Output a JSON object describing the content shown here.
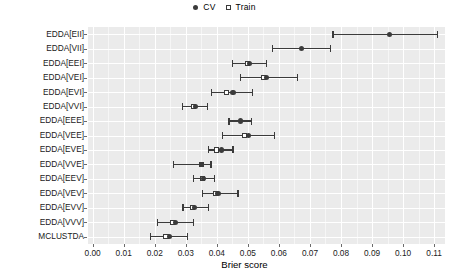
{
  "legend": {
    "position": "top-center",
    "items": [
      {
        "label": "CV",
        "marker": "filled-circle",
        "color": "#3b3b3b"
      },
      {
        "label": "Train",
        "marker": "open-square",
        "color": "#3b3b3b"
      }
    ]
  },
  "axes": {
    "xlabel": "Brier score",
    "ylabel": "",
    "xlim": [
      -0.0015,
      0.1135
    ],
    "xticks": [
      0.0,
      0.01,
      0.02,
      0.03,
      0.04,
      0.05,
      0.06,
      0.07,
      0.08,
      0.09,
      0.1,
      0.11
    ],
    "xticklabels": [
      "0.00",
      "0.01",
      "0.02",
      "0.03",
      "0.04",
      "0.05",
      "0.06",
      "0.07",
      "0.08",
      "0.09",
      "0.10",
      "0.11"
    ],
    "grid": "major+minor vertical, major horizontal, white on grey panel",
    "panel_color": "#ebebeb"
  },
  "chart_data": {
    "type": "scatter",
    "title": "",
    "subtitle": "",
    "xlabel": "Brier score",
    "ylabel": "",
    "xlim": [
      -0.0015,
      0.1135
    ],
    "grid": true,
    "legend_position": "top",
    "orientation": "horizontal-dotplot-with-errorbars",
    "categories": [
      "EDDA[EII]",
      "EDDA[VII]",
      "EDDA[EEI]",
      "EDDA[VEI]",
      "EDDA[EVI]",
      "EDDA[VVI]",
      "EDDA[EEE]",
      "EDDA[VEE]",
      "EDDA[EVE]",
      "EDDA[VVE]",
      "EDDA[EEV]",
      "EDDA[VEV]",
      "EDDA[EVV]",
      "EDDA[VVV]",
      "MCLUSTDA"
    ],
    "series": [
      {
        "name": "CV",
        "marker": "filled-circle",
        "values": [
          0.0955,
          0.0674,
          0.0506,
          0.056,
          0.0452,
          0.0332,
          0.0475,
          0.0503,
          0.0416,
          0.0351,
          0.0358,
          0.0404,
          0.0329,
          0.0268,
          0.0248
        ],
        "ci_low": [
          0.0774,
          0.058,
          0.0451,
          0.0477,
          0.0384,
          0.029,
          0.0439,
          0.0419,
          0.0374,
          0.0261,
          0.0326,
          0.0355,
          0.0291,
          0.0209,
          0.0186
        ],
        "ci_high": [
          0.111,
          0.0765,
          0.0561,
          0.0661,
          0.0516,
          0.0371,
          0.0512,
          0.0587,
          0.0452,
          0.0381,
          0.0393,
          0.0468,
          0.0374,
          0.0326,
          0.0306
        ]
      },
      {
        "name": "Train",
        "marker": "open-square",
        "values": [
          null,
          null,
          0.05,
          0.0551,
          0.0432,
          0.0325,
          null,
          0.049,
          0.04,
          0.0351,
          0.0355,
          0.0396,
          0.0321,
          0.0258,
          0.0236
        ]
      }
    ]
  },
  "rows": [
    {
      "label": "EDDA[EII]",
      "cv": 0.0955,
      "lo": 0.0774,
      "hi": 0.111,
      "train": null
    },
    {
      "label": "EDDA[VII]",
      "cv": 0.0674,
      "lo": 0.058,
      "hi": 0.0765,
      "train": null
    },
    {
      "label": "EDDA[EEI]",
      "cv": 0.0506,
      "lo": 0.0451,
      "hi": 0.0561,
      "train": 0.05
    },
    {
      "label": "EDDA[VEI]",
      "cv": 0.056,
      "lo": 0.0477,
      "hi": 0.0661,
      "train": 0.0551
    },
    {
      "label": "EDDA[EVI]",
      "cv": 0.0452,
      "lo": 0.0384,
      "hi": 0.0516,
      "train": 0.0432
    },
    {
      "label": "EDDA[VVI]",
      "cv": 0.0332,
      "lo": 0.029,
      "hi": 0.0371,
      "train": 0.0325
    },
    {
      "label": "EDDA[EEE]",
      "cv": 0.0475,
      "lo": 0.0439,
      "hi": 0.0512,
      "train": null
    },
    {
      "label": "EDDA[VEE]",
      "cv": 0.0503,
      "lo": 0.0419,
      "hi": 0.0587,
      "train": 0.049
    },
    {
      "label": "EDDA[EVE]",
      "cv": 0.0416,
      "lo": 0.0374,
      "hi": 0.0452,
      "train": 0.04
    },
    {
      "label": "EDDA[VVE]",
      "cv": 0.0351,
      "lo": 0.0261,
      "hi": 0.0381,
      "train": 0.0351
    },
    {
      "label": "EDDA[EEV]",
      "cv": 0.0358,
      "lo": 0.0326,
      "hi": 0.0393,
      "train": 0.0355
    },
    {
      "label": "EDDA[VEV]",
      "cv": 0.0404,
      "lo": 0.0355,
      "hi": 0.0468,
      "train": 0.0396
    },
    {
      "label": "EDDA[EVV]",
      "cv": 0.0329,
      "lo": 0.0291,
      "hi": 0.0374,
      "train": 0.0321
    },
    {
      "label": "EDDA[VVV]",
      "cv": 0.0268,
      "lo": 0.0209,
      "hi": 0.0326,
      "train": 0.0258
    },
    {
      "label": "MCLUSTDA",
      "cv": 0.0248,
      "lo": 0.0186,
      "hi": 0.0306,
      "train": 0.0236
    }
  ]
}
